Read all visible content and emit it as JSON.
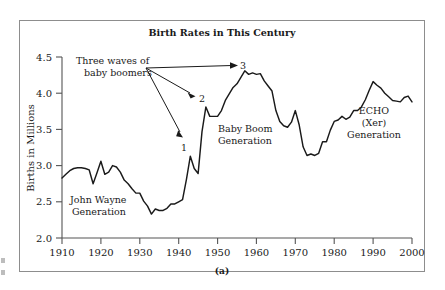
{
  "figure": {
    "caption": "(a)",
    "border_color": "#8d8d8d",
    "background": "#ffffff",
    "line_color": "#1a1a1a"
  },
  "chart_data": {
    "type": "line",
    "title": "Birth Rates in This Century",
    "xlabel": "",
    "ylabel": "Births in Millions",
    "xlim": [
      1910,
      2000
    ],
    "ylim": [
      2.0,
      4.5
    ],
    "xticks": [
      1910,
      1920,
      1930,
      1940,
      1950,
      1960,
      1970,
      1980,
      1990,
      2000
    ],
    "yticks": [
      "2.0",
      "2.5",
      "3.0",
      "3.5",
      "4.0",
      "4.5"
    ],
    "grid": false,
    "legend": "none",
    "series": [
      {
        "name": "Births in Millions",
        "x": [
          1910,
          1911,
          1912,
          1913,
          1914,
          1915,
          1916,
          1917,
          1918,
          1919,
          1920,
          1921,
          1922,
          1923,
          1924,
          1925,
          1926,
          1927,
          1928,
          1929,
          1930,
          1931,
          1932,
          1933,
          1934,
          1935,
          1936,
          1937,
          1938,
          1939,
          1940,
          1941,
          1942,
          1943,
          1944,
          1945,
          1946,
          1947,
          1948,
          1949,
          1950,
          1951,
          1952,
          1953,
          1954,
          1955,
          1956,
          1957,
          1958,
          1959,
          1960,
          1961,
          1962,
          1963,
          1964,
          1965,
          1966,
          1967,
          1968,
          1969,
          1970,
          1971,
          1972,
          1973,
          1974,
          1975,
          1976,
          1977,
          1978,
          1979,
          1980,
          1981,
          1982,
          1983,
          1984,
          1985,
          1986,
          1987,
          1988,
          1989,
          1990,
          1991,
          1992,
          1993,
          1994,
          1995,
          1996,
          1997,
          1998,
          1999,
          2000
        ],
        "values": [
          2.83,
          2.88,
          2.93,
          2.96,
          2.97,
          2.97,
          2.96,
          2.94,
          2.75,
          2.9,
          3.06,
          2.88,
          2.91,
          3.0,
          2.98,
          2.91,
          2.8,
          2.75,
          2.68,
          2.62,
          2.62,
          2.51,
          2.44,
          2.33,
          2.4,
          2.38,
          2.38,
          2.41,
          2.47,
          2.47,
          2.5,
          2.53,
          2.81,
          3.13,
          2.96,
          2.89,
          3.47,
          3.81,
          3.68,
          3.68,
          3.68,
          3.76,
          3.9,
          3.99,
          4.08,
          4.13,
          4.22,
          4.31,
          4.26,
          4.28,
          4.26,
          4.27,
          4.17,
          4.1,
          4.03,
          3.76,
          3.61,
          3.55,
          3.53,
          3.6,
          3.76,
          3.56,
          3.26,
          3.14,
          3.16,
          3.14,
          3.17,
          3.33,
          3.33,
          3.49,
          3.61,
          3.63,
          3.68,
          3.64,
          3.67,
          3.76,
          3.76,
          3.81,
          3.91,
          4.04,
          4.16,
          4.11,
          4.07,
          4.0,
          3.95,
          3.9,
          3.89,
          3.88,
          3.94,
          3.96,
          3.88
        ]
      }
    ],
    "annotations": [
      {
        "name": "three-waves-label",
        "text_line1": "Three waves of",
        "text_line2": "baby boomers"
      },
      {
        "name": "wave-1-label",
        "text": "1",
        "x": 1943,
        "y": 3.13
      },
      {
        "name": "wave-2-label",
        "text": "2",
        "x": 1947,
        "y": 3.81
      },
      {
        "name": "wave-3-label",
        "text": "3",
        "x": 1957,
        "y": 4.31
      },
      {
        "name": "john-wayne-label",
        "text_line1": "John Wayne",
        "text_line2": "Generation"
      },
      {
        "name": "baby-boom-label",
        "text_line1": "Baby Boom",
        "text_line2": "Generation"
      },
      {
        "name": "echo-label",
        "text_line1": "ECHO",
        "text_line2": "(Xer)",
        "text_line3": "Generation"
      }
    ]
  }
}
